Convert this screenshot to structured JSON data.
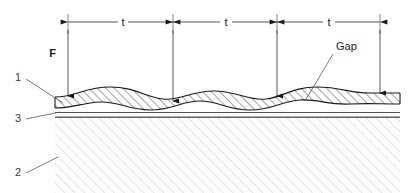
{
  "figure": {
    "title": "",
    "type": "technical-cross-section-diagram",
    "description_items": {
      "pitch_label": "t",
      "force_label": "F",
      "gap_label": "Gap",
      "ref_1": "1",
      "ref_2": "2",
      "ref_3": "3"
    }
  },
  "dimensions": {
    "pitch_spans": [
      {
        "label": "t",
        "x_start": 68,
        "x_end": 173,
        "y": 22
      },
      {
        "label": "t",
        "x_start": 173,
        "x_end": 277,
        "y": 22
      },
      {
        "label": "t",
        "x_start": 277,
        "x_end": 380,
        "y": 22
      }
    ]
  },
  "force_arrows": [
    {
      "label": "F",
      "x": 68,
      "y_top": 30,
      "y_bottom": 96
    },
    {
      "label": "",
      "x": 173,
      "y_top": 30,
      "y_bottom": 101
    },
    {
      "label": "",
      "x": 277,
      "y_top": 30,
      "y_bottom": 96
    },
    {
      "label": "",
      "x": 380,
      "y_top": 30,
      "y_bottom": 93
    }
  ],
  "callouts": [
    {
      "name": "gap",
      "text": "Gap",
      "text_x": 336,
      "text_y": 50,
      "leader_to_x": 305,
      "leader_to_y": 101
    },
    {
      "name": "ref-1",
      "text": "1",
      "text_x": 18,
      "text_y": 81,
      "leader_to_x": 63,
      "leader_to_y": 103
    },
    {
      "name": "ref-3",
      "text": "3",
      "text_x": 18,
      "text_y": 122,
      "leader_to_x": 60,
      "leader_to_y": 113
    },
    {
      "name": "ref-2",
      "text": "2",
      "text_x": 18,
      "text_y": 176,
      "leader_to_x": 58,
      "leader_to_y": 157
    }
  ],
  "colors": {
    "line": "#1a1a1a",
    "thin_line": "#2b2b2b",
    "leader": "#555555",
    "hatch_upper": "#333333",
    "hatch_substrate": "#c8c8c8",
    "background": "#ffffff"
  },
  "layers": {
    "wavy_sheet": {
      "ref": "1",
      "hatch_direction": "45deg",
      "hatch_color": "#333333"
    },
    "substrate": {
      "ref": "2",
      "hatch_direction": "45deg",
      "hatch_color": "#c8c8c8"
    },
    "flat_interlayer": {
      "ref": "3"
    }
  }
}
